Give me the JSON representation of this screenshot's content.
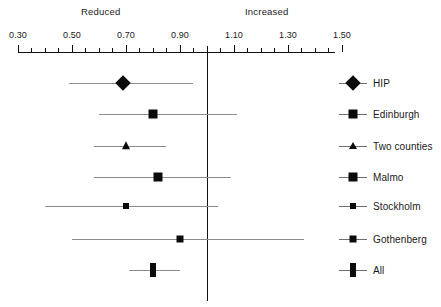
{
  "header": {
    "left_direction_label": "Reduced",
    "right_direction_label": "Increased"
  },
  "axis": {
    "major_tick_labels": [
      "0.30",
      "0.50",
      "0.70",
      "0.90",
      "1.10",
      "1.30",
      "1.50"
    ],
    "major_tick_values": [
      0.3,
      0.5,
      0.7,
      0.9,
      1.1,
      1.3,
      1.5
    ],
    "minor_tick_step": 0.05,
    "range_min": 0.3,
    "range_max": 1.5,
    "null_value": 1.0,
    "line_color": "#111111",
    "ci_color": "#8c8c8c"
  },
  "legend": {
    "items": [
      {
        "label": "HIP",
        "marker": "diamond"
      },
      {
        "label": "Edinburgh",
        "marker": "square"
      },
      {
        "label": "Two counties",
        "marker": "triangle"
      },
      {
        "label": "Malmo",
        "marker": "square"
      },
      {
        "label": "Stockholm",
        "marker": "square-small"
      },
      {
        "label": "Gothenberg",
        "marker": "square-small"
      },
      {
        "label": "All",
        "marker": "rect-tall"
      }
    ]
  },
  "chart_data": {
    "type": "forest",
    "title": "",
    "xlabel": "",
    "ylabel": "",
    "xlim": [
      0.3,
      1.5
    ],
    "null_line": 1.0,
    "grid": false,
    "left_annotation": "Reduced",
    "right_annotation": "Increased",
    "studies": [
      {
        "name": "HIP",
        "estimate": 0.69,
        "ci_low": 0.49,
        "ci_high": 0.95,
        "marker": "diamond",
        "marker_w": 11,
        "marker_h": 11
      },
      {
        "name": "Edinburgh",
        "estimate": 0.8,
        "ci_low": 0.6,
        "ci_high": 1.11,
        "marker": "square",
        "marker_w": 9,
        "marker_h": 9
      },
      {
        "name": "Two counties",
        "estimate": 0.7,
        "ci_low": 0.58,
        "ci_high": 0.85,
        "marker": "triangle",
        "marker_w": 9,
        "marker_h": 8
      },
      {
        "name": "Malmo",
        "estimate": 0.82,
        "ci_low": 0.58,
        "ci_high": 1.09,
        "marker": "square",
        "marker_w": 9,
        "marker_h": 9
      },
      {
        "name": "Stockholm",
        "estimate": 0.7,
        "ci_low": 0.4,
        "ci_high": 1.04,
        "marker": "square-small",
        "marker_w": 6,
        "marker_h": 6
      },
      {
        "name": "Gothenberg",
        "estimate": 0.9,
        "ci_low": 0.5,
        "ci_high": 1.36,
        "marker": "square-small",
        "marker_w": 7,
        "marker_h": 7
      },
      {
        "name": "All",
        "estimate": 0.8,
        "ci_low": 0.71,
        "ci_high": 0.9,
        "marker": "rect-tall",
        "marker_w": 6,
        "marker_h": 14
      }
    ],
    "row_y": [
      83,
      114,
      146,
      177,
      206,
      239,
      270
    ]
  },
  "geometry": {
    "axis_left_px": 18,
    "axis_right_px": 335,
    "axis_y_px": 52,
    "null_x_px": 207
  }
}
